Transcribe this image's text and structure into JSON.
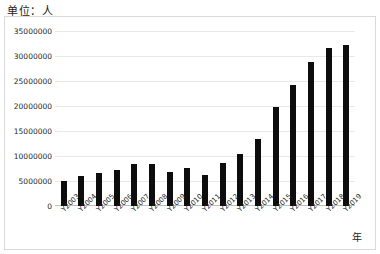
{
  "caption": {
    "unit_label": "单位：人"
  },
  "axis": {
    "x_title": "年",
    "y_ticks": [
      "0",
      "5000000",
      "10000000",
      "15000000",
      "20000000",
      "25000000",
      "30000000",
      "35000000"
    ]
  },
  "chart_data": {
    "type": "bar",
    "title": "",
    "subtitle": "",
    "xlabel": "年",
    "ylabel": "单位：人",
    "categories": [
      "Y2003",
      "Y2004",
      "Y2005",
      "Y2006",
      "Y2007",
      "Y2008",
      "Y2009",
      "Y2010",
      "Y2011",
      "Y2012",
      "Y2013",
      "Y2014",
      "Y2015",
      "Y2016",
      "Y2017",
      "Y2018",
      "Y2019"
    ],
    "values": [
      5100000,
      6100000,
      6700000,
      7300000,
      8400000,
      8400000,
      6800000,
      7600000,
      6200000,
      8600000,
      10500000,
      13500000,
      19800000,
      24200000,
      28900000,
      31700000,
      32300000
    ],
    "ylim": [
      0,
      35000000
    ],
    "ytick_step": 5000000,
    "grid": true,
    "legend": "none",
    "bar_color": "#0d0d0d"
  }
}
